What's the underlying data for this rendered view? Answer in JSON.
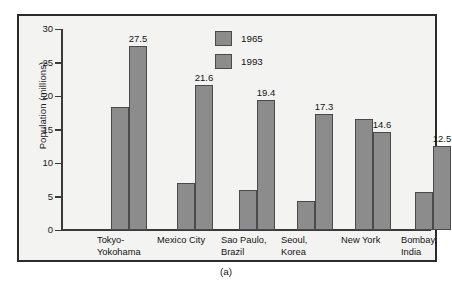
{
  "figure": {
    "caption": "(a)"
  },
  "chart_data": {
    "type": "bar",
    "title": "",
    "xlabel": "",
    "ylabel": "Population (millions)",
    "ylim": [
      0,
      30
    ],
    "yticks": [
      0,
      5,
      10,
      15,
      20,
      25,
      30
    ],
    "ytick_labels": [
      "0",
      "5",
      "10",
      "15",
      "20",
      "25",
      "30"
    ],
    "grid": false,
    "legend_position": "top-center",
    "categories": [
      "Tokyo-\nYokohama",
      "Mexico City",
      "Sao Paulo,\nBrazil",
      "Seoul,\nKorea",
      "New York",
      "Bombay,\nIndia"
    ],
    "category_lines": [
      [
        "Tokyo-",
        "Yokohama"
      ],
      [
        "Mexico City",
        ""
      ],
      [
        "Sao Paulo,",
        "Brazil"
      ],
      [
        "Seoul,",
        "Korea"
      ],
      [
        "New York",
        ""
      ],
      [
        "Bombay,",
        "India"
      ]
    ],
    "series": [
      {
        "name": "1965",
        "color": "#8c8c8c",
        "values": [
          18.3,
          7.0,
          5.9,
          4.3,
          16.5,
          5.6
        ],
        "labels": [
          "",
          "",
          "",
          "",
          "",
          ""
        ]
      },
      {
        "name": "1993",
        "color": "#8c8c8c",
        "values": [
          27.5,
          21.6,
          19.4,
          17.3,
          14.6,
          12.5
        ],
        "labels": [
          "27.5",
          "21.6",
          "19.4",
          "17.3",
          "14.6",
          "12.5"
        ]
      }
    ]
  },
  "legend": {
    "items": [
      {
        "label": "1965",
        "color": "#8c8c8c"
      },
      {
        "label": "1993",
        "color": "#8c8c8c"
      }
    ]
  },
  "colors": {
    "bar_fill": "#8c8c8c",
    "bar_stroke": "#4a4a4a",
    "axis": "#3a3a3a",
    "border": "#2b2b2b",
    "background": "#f3f3f1",
    "text": "#141414"
  }
}
